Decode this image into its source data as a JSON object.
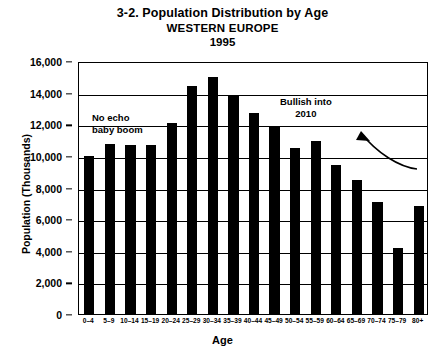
{
  "chart_data": {
    "type": "bar",
    "title": "3-2. Population Distribution by Age",
    "subtitle": "WESTERN EUROPE",
    "year": "1995",
    "xlabel": "Age",
    "ylabel": "Population (Thousands)",
    "categories": [
      "0–4",
      "5–9",
      "10–14",
      "15–19",
      "20–24",
      "25–29",
      "30–34",
      "35–39",
      "40–44",
      "45–49",
      "50–54",
      "55–59",
      "60–64",
      "65–69",
      "70–74",
      "75–79",
      "80+"
    ],
    "values": [
      10000,
      10750,
      10700,
      10700,
      12100,
      14450,
      15000,
      13800,
      12700,
      11800,
      10500,
      10950,
      9400,
      8500,
      7100,
      4200,
      6800
    ],
    "ylim": [
      0,
      16000
    ],
    "ytick_labels": [
      "16,000",
      "14,000",
      "12,000",
      "10,000",
      "8,000",
      "6,000",
      "4,000",
      "2,000",
      "0"
    ],
    "ytick_values": [
      16000,
      14000,
      12000,
      10000,
      8000,
      6000,
      4000,
      2000,
      0
    ],
    "grid": true,
    "legend": "none",
    "bar_color": "#000000",
    "annotations": [
      {
        "id": "no-echo",
        "text": "No echo\nbaby boom"
      },
      {
        "id": "bullish",
        "text": "Bullish into\n2010"
      }
    ]
  }
}
